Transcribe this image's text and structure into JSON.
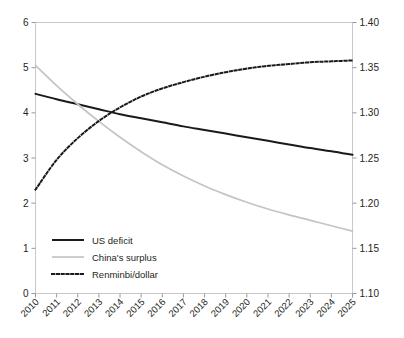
{
  "chart_data": {
    "type": "line",
    "title": "",
    "subtitle": "",
    "xlabel": "",
    "ylabel": "",
    "y2label": "",
    "grid": false,
    "legend_position": "bottom-left",
    "x": [
      2010,
      2011,
      2012,
      2013,
      2014,
      2015,
      2016,
      2017,
      2018,
      2019,
      2020,
      2021,
      2022,
      2023,
      2024,
      2025
    ],
    "x_tick_labels": [
      "2010",
      "2011",
      "2012",
      "2013",
      "2014",
      "2015",
      "2016",
      "2017",
      "2018",
      "2019",
      "2020",
      "2021",
      "2022",
      "2023",
      "2024",
      "2025"
    ],
    "x_tick_rotation": 45,
    "ylim": [
      0,
      6
    ],
    "y_ticks": [
      0,
      1,
      2,
      3,
      4,
      5,
      6
    ],
    "y_tick_labels": [
      "0",
      "1",
      "2",
      "3",
      "4",
      "5",
      "6"
    ],
    "y2lim": [
      1.1,
      1.4
    ],
    "y2_ticks": [
      1.1,
      1.15,
      1.2,
      1.25,
      1.3,
      1.35,
      1.4
    ],
    "y2_tick_labels": [
      "1.10",
      "1.15",
      "1.20",
      "1.25",
      "1.30",
      "1.35",
      "1.40"
    ],
    "series": [
      {
        "name": "US deficit",
        "axis": "left",
        "style": "solid",
        "color": "#1a1a1a",
        "width": 2.0,
        "values": [
          4.42,
          4.3,
          4.19,
          4.08,
          3.97,
          3.88,
          3.79,
          3.7,
          3.62,
          3.54,
          3.46,
          3.38,
          3.3,
          3.22,
          3.15,
          3.07
        ]
      },
      {
        "name": "China's surplus",
        "axis": "left",
        "style": "solid",
        "color": "#c4c4c4",
        "width": 1.7,
        "values": [
          5.05,
          4.6,
          4.19,
          3.81,
          3.46,
          3.14,
          2.85,
          2.6,
          2.38,
          2.19,
          2.02,
          1.87,
          1.74,
          1.62,
          1.5,
          1.38
        ]
      },
      {
        "name": "Renminbi/dollar",
        "axis": "right",
        "style": "dotted",
        "color": "#1a1a1a",
        "width": 2.0,
        "values": [
          1.215,
          1.248,
          1.272,
          1.291,
          1.306,
          1.318,
          1.327,
          1.334,
          1.34,
          1.345,
          1.349,
          1.352,
          1.354,
          1.356,
          1.357,
          1.358
        ]
      }
    ]
  },
  "legend": {
    "items": [
      {
        "label": "US deficit",
        "style": "solid",
        "color": "#1a1a1a"
      },
      {
        "label": "China's surplus",
        "style": "solid",
        "color": "#c4c4c4"
      },
      {
        "label": "Renminbi/dollar",
        "style": "dotted",
        "color": "#1a1a1a"
      }
    ]
  },
  "colors": {
    "background": "#ffffff",
    "frame": "#c9c9c9",
    "text": "#231f20",
    "series_us_deficit": "#1a1a1a",
    "series_china_surplus": "#c4c4c4",
    "series_renminbi": "#1a1a1a"
  }
}
